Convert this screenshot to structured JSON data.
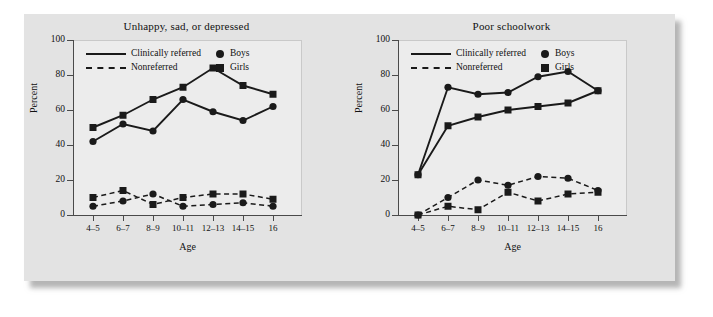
{
  "figure": {
    "panels": [
      "left",
      "right"
    ]
  },
  "legend": {
    "clinically_referred": "Clinically referred",
    "nonreferred": "Nonreferred",
    "boys": "Boys",
    "girls": "Girls",
    "boys_marker": "circle-marker",
    "girls_marker": "square-marker",
    "referred_style": "solid-line",
    "nonreferred_style": "dashed-line"
  },
  "axes": {
    "ylabel": "Percent",
    "xlabel": "Age",
    "yticks": [
      100,
      80,
      60,
      40,
      20,
      0
    ],
    "ylim": [
      0,
      100
    ],
    "categories": [
      "4–5",
      "6–7",
      "8–9",
      "10–11",
      "12–13",
      "14–15",
      "16"
    ]
  },
  "colors": {
    "card": "#e3e3e3",
    "plot_background": "#ececec",
    "ink": "#1a1a1a",
    "axis": "#4a4a4a",
    "page": "#ffffff"
  },
  "chart_data": [
    {
      "type": "line",
      "title": "Unhappy, sad, or depressed",
      "xlabel": "Age",
      "ylabel": "Percent",
      "ylim": [
        0,
        100
      ],
      "yticks": [
        0,
        20,
        40,
        60,
        80,
        100
      ],
      "grid": false,
      "legend_position": "top-left-inside",
      "categories": [
        "4–5",
        "6–7",
        "8–9",
        "10–11",
        "12–13",
        "14–15",
        "16"
      ],
      "series": [
        {
          "name": "Clinically referred – Girls",
          "line": "solid",
          "marker": "square",
          "values": [
            50,
            57,
            66,
            73,
            84,
            74,
            69
          ]
        },
        {
          "name": "Clinically referred – Boys",
          "line": "solid",
          "marker": "circle",
          "values": [
            42,
            52,
            48,
            66,
            59,
            54,
            62
          ]
        },
        {
          "name": "Nonreferred – Girls",
          "line": "dashed",
          "marker": "square",
          "values": [
            10,
            14,
            6,
            10,
            12,
            12,
            9
          ]
        },
        {
          "name": "Nonreferred – Boys",
          "line": "dashed",
          "marker": "circle",
          "values": [
            5,
            8,
            12,
            5,
            6,
            7,
            5
          ]
        }
      ]
    },
    {
      "type": "line",
      "title": "Poor schoolwork",
      "xlabel": "Age",
      "ylabel": "Percent",
      "ylim": [
        0,
        100
      ],
      "yticks": [
        0,
        20,
        40,
        60,
        80,
        100
      ],
      "grid": false,
      "legend_position": "top-left-inside",
      "categories": [
        "4–5",
        "6–7",
        "8–9",
        "10–11",
        "12–13",
        "14–15",
        "16"
      ],
      "series": [
        {
          "name": "Clinically referred – Boys",
          "line": "solid",
          "marker": "circle",
          "values": [
            23,
            73,
            69,
            70,
            79,
            82,
            71
          ]
        },
        {
          "name": "Clinically referred – Girls",
          "line": "solid",
          "marker": "square",
          "values": [
            23,
            51,
            56,
            60,
            62,
            64,
            71
          ]
        },
        {
          "name": "Nonreferred – Boys",
          "line": "dashed",
          "marker": "circle",
          "values": [
            0,
            10,
            20,
            17,
            22,
            21,
            14
          ]
        },
        {
          "name": "Nonreferred – Girls",
          "line": "dashed",
          "marker": "square",
          "values": [
            0,
            5,
            3,
            13,
            8,
            12,
            13
          ]
        }
      ]
    }
  ]
}
